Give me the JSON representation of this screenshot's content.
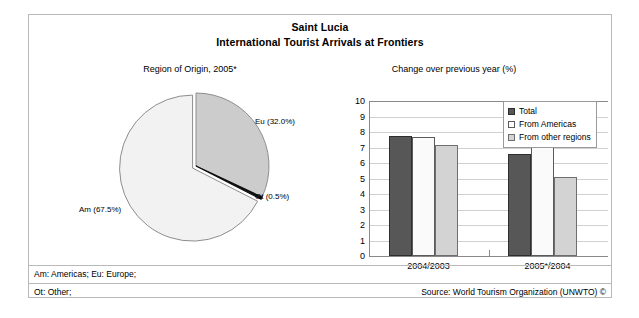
{
  "header": {
    "title": "Saint Lucia",
    "subtitle": "International Tourist Arrivals at Frontiers"
  },
  "panels": {
    "pie_caption": "Region of Origin, 2005*",
    "bar_caption": "Change over previous year (%)"
  },
  "footer": {
    "abbrev_line_1": "Am: Americas; Eu: Europe;",
    "abbrev_line_2": "Ot: Other;",
    "source": "Source: World Tourism Organization (UNWTO) ©"
  },
  "pie_labels": {
    "eu": "Eu (32.0%)",
    "am": "Am (67.5%)",
    "ot": "Ot (0.5%)"
  },
  "colors": {
    "pie_europe": "#cccccc",
    "pie_americas": "#f2f2f2",
    "pie_other": "#101010",
    "bar_total": "#575757",
    "bar_americas": "#fafafa",
    "bar_other_regions": "#d3d3d3",
    "frame": "#b9b9b9",
    "gridline": "#d0d0d0"
  },
  "chart_data": [
    {
      "type": "pie",
      "title": "Region of Origin, 2005*",
      "categories": [
        "Am",
        "Eu",
        "Ot"
      ],
      "labels": [
        "Am (67.5%)",
        "Eu (32.0%)",
        "Ot (0.5%)"
      ],
      "values": [
        67.5,
        32.0,
        0.5
      ],
      "unit": "%",
      "legend": "none",
      "notes": "Exploded pie; Americas slice slightly separated. Am=light, Eu=grey, Ot=thin black sliver."
    },
    {
      "type": "bar",
      "title": "Change over previous year (%)",
      "xlabel": "",
      "ylabel": "",
      "ylim": [
        0,
        10
      ],
      "ytick_step": 1,
      "yticks": [
        10,
        9,
        8,
        7,
        6,
        5,
        4,
        3,
        2,
        1,
        0
      ],
      "grid": true,
      "legend_position": "top-right",
      "categories": [
        "2004/2003",
        "2005*/2004"
      ],
      "series": [
        {
          "name": "Total",
          "values": [
            7.75,
            6.55
          ]
        },
        {
          "name": "From Americas",
          "values": [
            7.65,
            8.7
          ]
        },
        {
          "name": "From other regions",
          "values": [
            7.15,
            5.1
          ]
        }
      ]
    }
  ]
}
